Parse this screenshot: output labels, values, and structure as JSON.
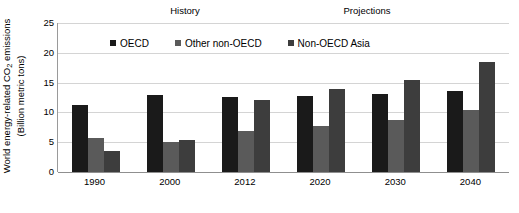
{
  "chart_data": {
    "type": "bar",
    "title": "",
    "xlabel": "",
    "ylabel_line1": "World energy-related  CO",
    "ylabel_sub": "2",
    "ylabel_line1_tail": " emissions",
    "ylabel_line2": "(Billion metric tons)",
    "categories": [
      "1990",
      "2000",
      "2012",
      "2020",
      "2030",
      "2040"
    ],
    "series": [
      {
        "name": "OECD",
        "color": "#1a1a1a",
        "values": [
          11.3,
          12.9,
          12.6,
          12.8,
          13.1,
          13.6
        ]
      },
      {
        "name": "Other non-OECD",
        "color": "#5a5a5a",
        "values": [
          5.7,
          5.0,
          6.9,
          7.7,
          8.7,
          10.4
        ]
      },
      {
        "name": "Non-OECD Asia",
        "color": "#3d3d3d",
        "values": [
          3.5,
          5.3,
          12.1,
          13.9,
          15.4,
          18.5
        ]
      }
    ],
    "ylim": [
      0,
      25
    ],
    "yticks": [
      0,
      5,
      10,
      15,
      20,
      25
    ],
    "grid": true,
    "legend_position": "top-inside",
    "annotations": [
      {
        "name": "history",
        "text": "History"
      },
      {
        "name": "projections",
        "text": "Projections"
      }
    ]
  },
  "legend": {
    "items": [
      {
        "label": "OECD"
      },
      {
        "label": "Other non-OECD"
      },
      {
        "label": "Non-OECD Asia"
      }
    ]
  },
  "annotations": {
    "history": "History",
    "projections": "Projections"
  },
  "colors": {
    "series_1": "#1a1a1a",
    "series_2": "#5a5a5a",
    "series_3": "#3d3d3d",
    "gridline": "#d4d4d4",
    "axis": "#8f8f8f",
    "background": "#ffffff",
    "text": "#000000"
  }
}
